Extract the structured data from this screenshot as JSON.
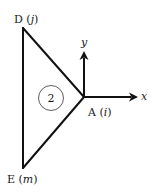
{
  "diagram": {
    "type": "triangular-element",
    "element_number": "2",
    "nodes": [
      {
        "id": "D",
        "label_main": "D",
        "label_local": "j",
        "x": 23,
        "y": 28
      },
      {
        "id": "A",
        "label_main": "A",
        "label_local": "i",
        "x": 84,
        "y": 97
      },
      {
        "id": "E",
        "label_main": "E",
        "label_local": "m",
        "x": 23,
        "y": 168
      }
    ],
    "axes": {
      "x_label": "x",
      "y_label": "y",
      "origin_node": "A"
    },
    "colors": {
      "stroke": "#111111",
      "background": "#ffffff"
    }
  }
}
